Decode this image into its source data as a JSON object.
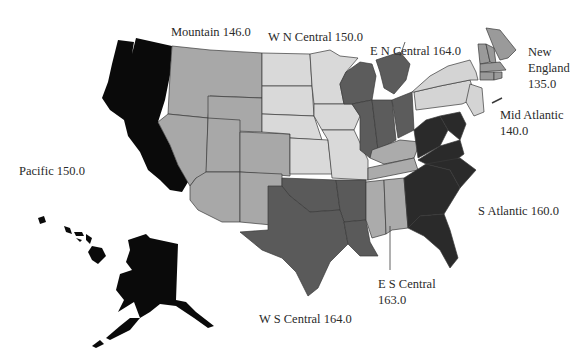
{
  "map": {
    "type": "choropleth",
    "subject": "United States census divisions",
    "colors": {
      "pacific": "#0a0a0a",
      "mountain": "#a8a8a8",
      "wn_central": "#d9d9d9",
      "en_central": "#5c5c5c",
      "ws_central": "#5a5a5a",
      "es_central": "#ababab",
      "s_atlantic": "#2a2a2a",
      "mid_atlantic": "#d4d4d4",
      "new_england": "#9a9a9a",
      "background": "#ffffff",
      "border": "#3a3a3a"
    },
    "regions": [
      {
        "id": "pacific",
        "name": "Pacific",
        "value": "150.0"
      },
      {
        "id": "mountain",
        "name": "Mountain",
        "value": "146.0"
      },
      {
        "id": "wn_central",
        "name": "W N Central",
        "value": "150.0"
      },
      {
        "id": "en_central",
        "name": "E N Central",
        "value": "164.0"
      },
      {
        "id": "new_england",
        "name": "New England",
        "name_line1": "New",
        "name_line2": "England",
        "value": "135.0"
      },
      {
        "id": "mid_atlantic",
        "name": "Mid Atlantic",
        "value": "140.0"
      },
      {
        "id": "s_atlantic",
        "name": "S Atlantic",
        "value": "160.0"
      },
      {
        "id": "es_central",
        "name": "E S Central",
        "value": "163.0"
      },
      {
        "id": "ws_central",
        "name": "W S Central",
        "value": "164.0"
      }
    ]
  }
}
